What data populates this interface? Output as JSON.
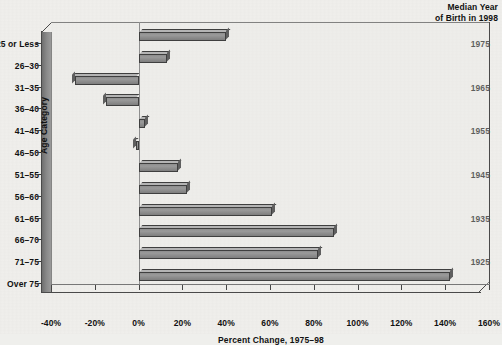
{
  "header": {
    "median_year_line1": "Median Year",
    "median_year_line2": "of Birth in 1998"
  },
  "axes": {
    "x_title": "Percent Change, 1975–98",
    "y_title": "Age Category",
    "x_ticks": [
      "-40%",
      "-20%",
      "0%",
      "20%",
      "40%",
      "60%",
      "80%",
      "100%",
      "120%",
      "140%",
      "160%"
    ]
  },
  "chart_data": {
    "type": "bar",
    "orientation": "horizontal",
    "title": "",
    "subtitle": "",
    "xlabel": "Percent Change, 1975–98",
    "ylabel": "Age Category",
    "xlim": [
      -40,
      160
    ],
    "xtick_values": [
      -40,
      -20,
      0,
      20,
      40,
      60,
      80,
      100,
      120,
      140,
      160
    ],
    "xtick_labels": [
      "-40%",
      "-20%",
      "0%",
      "20%",
      "40%",
      "60%",
      "80%",
      "100%",
      "120%",
      "140%",
      "160%"
    ],
    "grid": false,
    "legend": "none",
    "categories": [
      "25 or Less",
      "26–30",
      "31–35",
      "36–40",
      "41–45",
      "46–50",
      "51–55",
      "56–60",
      "61–65",
      "66–70",
      "71–75",
      "Over 75"
    ],
    "values": [
      40,
      13,
      -29,
      -15,
      3,
      -1,
      18,
      22,
      61,
      89,
      82,
      142
    ],
    "secondary_axis": {
      "label_line1": "Median Year",
      "label_line2": "of Birth in 1998",
      "ticks": [
        {
          "category": "25 or Less",
          "value": "1975"
        },
        {
          "category": "31–35",
          "value": "1965"
        },
        {
          "category": "41–45",
          "value": "1955"
        },
        {
          "category": "51–55",
          "value": "1945"
        },
        {
          "category": "61–65",
          "value": "1935"
        },
        {
          "category": "71–75",
          "value": "1925"
        }
      ]
    },
    "colors": {
      "bar_face": "#8f8f8f",
      "bar_edge": "#3f3f3f",
      "background": "#f0efec",
      "axis": "#444444"
    }
  }
}
